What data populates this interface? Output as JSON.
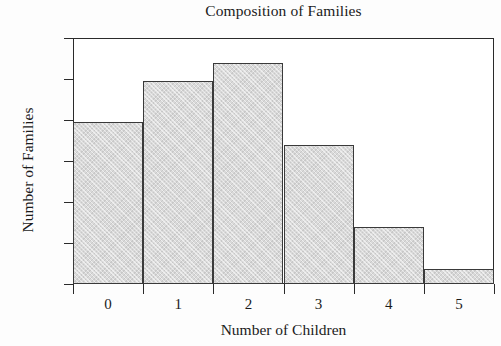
{
  "chart_data": {
    "type": "bar",
    "title": "Composition of Families",
    "xlabel": "Number of Children",
    "ylabel": "Number of Families",
    "categories": [
      "0",
      "1",
      "2",
      "3",
      "4",
      "5"
    ],
    "values": [
      7.9,
      9.9,
      10.8,
      6.8,
      2.8,
      0.75
    ],
    "series": [
      {
        "name": "Number of Families",
        "values": [
          7.9,
          9.9,
          10.8,
          6.8,
          2.8,
          0.75
        ]
      }
    ],
    "ylim": [
      0,
      12
    ],
    "yticks": [
      0,
      2,
      4,
      6,
      8,
      10,
      12
    ],
    "ytick_labels": [
      "0",
      "2",
      "4",
      "6",
      "8",
      "10",
      "12"
    ],
    "xtick_labels": [
      "0",
      "1",
      "2",
      "3",
      "4",
      "5"
    ],
    "xlim": [
      -0.5,
      5.5
    ],
    "grid": false,
    "legend": false,
    "legend_position": "none",
    "bar_fill_color": "#d9d9d9",
    "bar_edge_color": "#3a3a3a",
    "axis_color": "#2a2a2a",
    "background_color": "#ffffff",
    "annotations": []
  }
}
